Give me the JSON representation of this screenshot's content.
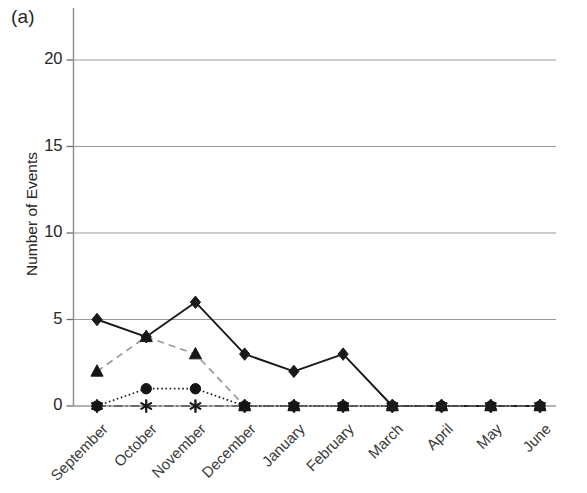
{
  "figure": {
    "panel_label": "(a)",
    "ylabel": "Number of Events"
  },
  "chart_data": {
    "type": "line",
    "title": "",
    "panel": "(a)",
    "xlabel": "",
    "ylabel": "Number of Events",
    "ylim": [
      0,
      22
    ],
    "yticks": [
      0,
      5,
      10,
      15,
      20
    ],
    "ytick_labels": [
      "0",
      "5",
      "10",
      "15",
      "20"
    ],
    "grid": true,
    "grid_axis": "y",
    "legend": "none",
    "categories": [
      "September",
      "October",
      "November",
      "December",
      "January",
      "February",
      "March",
      "April",
      "May",
      "June"
    ],
    "series": [
      {
        "name": "series-diamond",
        "marker": "diamond",
        "line_style": "solid",
        "color": "#1a1a1a",
        "values": [
          5,
          4,
          6,
          3,
          2,
          3,
          0,
          0,
          0,
          0
        ]
      },
      {
        "name": "series-triangle",
        "marker": "triangle",
        "line_style": "dashed",
        "color": "#9a9a9a",
        "values": [
          2,
          4,
          3,
          0,
          0,
          0,
          0,
          0,
          0,
          0
        ]
      },
      {
        "name": "series-circle",
        "marker": "circle",
        "line_style": "dotted",
        "color": "#1a1a1a",
        "values": [
          0,
          1,
          1,
          0,
          0,
          0,
          0,
          0,
          0,
          0
        ]
      },
      {
        "name": "series-star",
        "marker": "star",
        "line_style": "dashdot",
        "color": "#555555",
        "values": [
          0,
          0,
          0,
          0,
          0,
          0,
          0,
          0,
          0,
          0
        ]
      }
    ]
  }
}
